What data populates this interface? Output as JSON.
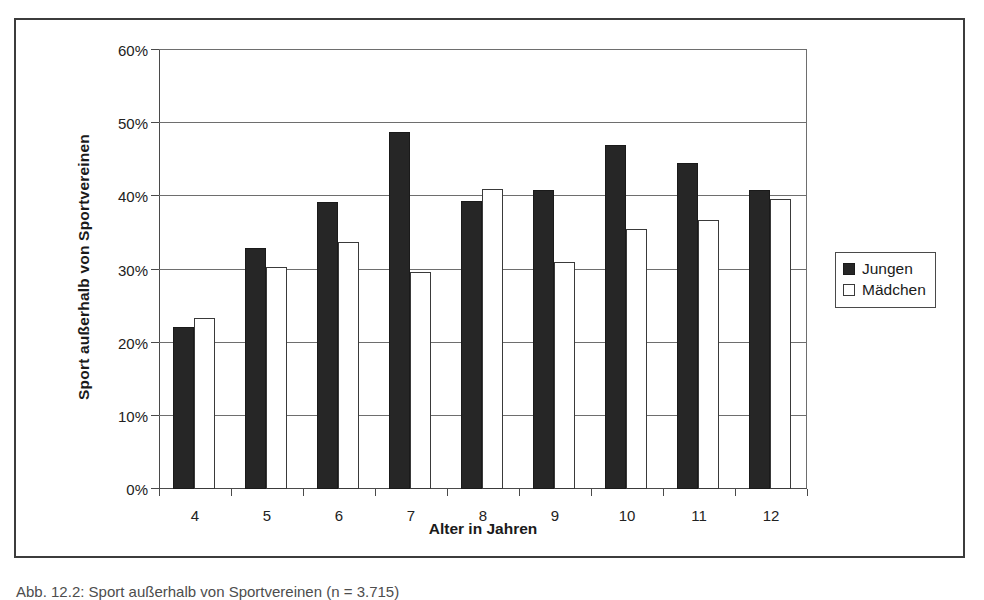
{
  "figure": {
    "caption": "Abb. 12.2:  Sport außerhalb von Sportvereinen (n = 3.715)",
    "legend_position": "right"
  },
  "chart_data": {
    "type": "bar",
    "title": "",
    "xlabel": "Alter in Jahren",
    "ylabel": "Sport außerhalb von Sportvereinen",
    "categories": [
      "4",
      "5",
      "6",
      "7",
      "8",
      "9",
      "10",
      "11",
      "12"
    ],
    "ytick_labels": [
      "0%",
      "10%",
      "20%",
      "30%",
      "40%",
      "50%",
      "60%"
    ],
    "ytick_values": [
      0,
      10,
      20,
      30,
      40,
      50,
      60
    ],
    "ylim": [
      0,
      60
    ],
    "grid": true,
    "value_suffix": "%",
    "series": [
      {
        "name": "Jungen",
        "color": "#262626",
        "swatch": "filled",
        "values": [
          22.1,
          32.9,
          39.2,
          48.8,
          39.3,
          40.8,
          47.0,
          44.5,
          40.8
        ]
      },
      {
        "name": "Mädchen",
        "color": "#ffffff",
        "swatch": "hollow",
        "values": [
          23.4,
          30.3,
          33.8,
          29.7,
          41.0,
          31.0,
          35.5,
          36.7,
          39.6
        ]
      }
    ]
  }
}
